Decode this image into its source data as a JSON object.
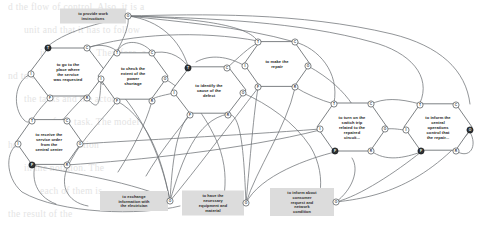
{
  "diagram": {
    "type": "hexagonal-port-node-graph",
    "canvas": {
      "width": 487,
      "height": 229
    },
    "colors": {
      "edge": "#6d7275",
      "hex_fill": "#ffffff",
      "hex_stroke": "#5c6164",
      "plate_fill": "#dcdcdc",
      "port_off_fill": "#ffffff",
      "port_on_fill": "#2e3234",
      "text": "#1d1d1d",
      "bleed_text": "#c9c9c9"
    },
    "port_legend": {
      "T": "top-left port",
      "C": "top-right port",
      "I": "left port",
      "O": "right port",
      "F": "bottom-left port",
      "R": "bottom-right port"
    }
  },
  "nodes": [
    {
      "id": "provide-work-instructions",
      "shape": "plate",
      "label": "to provide work instructions",
      "lines": [
        "to provide work",
        "instructions"
      ],
      "cx": 93,
      "cy": 16,
      "w": 66,
      "h": 15,
      "ports": [
        {
          "key": "O",
          "label": "O",
          "x": 128,
          "y": 16,
          "on": false
        }
      ]
    },
    {
      "id": "go-to-place",
      "shape": "hex",
      "label": "to go to the place where the service was requested",
      "lines": [
        "to go to the",
        "place where",
        "the service",
        "was requested"
      ],
      "cx": 68,
      "cy": 72,
      "rx": 38,
      "ry": 30,
      "ports": [
        {
          "key": "T",
          "label": "T",
          "x": 48,
          "y": 48,
          "on": true
        },
        {
          "key": "C",
          "label": "C",
          "x": 87,
          "y": 48,
          "on": false
        },
        {
          "key": "I",
          "label": "I",
          "x": 31,
          "y": 74,
          "on": false
        },
        {
          "key": "O",
          "label": "O",
          "x": 104,
          "y": 74,
          "on": false
        },
        {
          "key": "F",
          "label": "F",
          "x": 50,
          "y": 98,
          "on": false
        },
        {
          "key": "R",
          "label": "R",
          "x": 87,
          "y": 98,
          "on": false
        }
      ]
    },
    {
      "id": "check-extent-shortage",
      "shape": "hex",
      "label": "to check the extent of the power shortage",
      "lines": [
        "to check the",
        "extent of the",
        "power",
        "shortage"
      ],
      "cx": 133,
      "cy": 76,
      "rx": 35,
      "ry": 29,
      "ports": [
        {
          "key": "T",
          "label": "T",
          "x": 117,
          "y": 53,
          "on": false
        },
        {
          "key": "C",
          "label": "C",
          "x": 152,
          "y": 53,
          "on": false
        },
        {
          "key": "I",
          "label": "I",
          "x": 101,
          "y": 79,
          "on": false
        },
        {
          "key": "O",
          "label": "O",
          "x": 165,
          "y": 79,
          "on": false
        },
        {
          "key": "F",
          "label": "F",
          "x": 117,
          "y": 101,
          "on": false
        },
        {
          "key": "R",
          "label": "R",
          "x": 152,
          "y": 101,
          "on": false
        }
      ]
    },
    {
      "id": "identify-cause-defect",
      "shape": "hex",
      "label": "to identify the cause of the defect",
      "lines": [
        "to identify the",
        "cause of the",
        "defect"
      ],
      "cx": 209,
      "cy": 90,
      "rx": 37,
      "ry": 29,
      "ports": [
        {
          "key": "T",
          "label": "T",
          "x": 188,
          "y": 68,
          "on": true
        },
        {
          "key": "C",
          "label": "C",
          "x": 227,
          "y": 68,
          "on": false
        },
        {
          "key": "I",
          "label": "I",
          "x": 174,
          "y": 93,
          "on": false
        },
        {
          "key": "O",
          "label": "O",
          "x": 243,
          "y": 93,
          "on": false
        },
        {
          "key": "F",
          "label": "F",
          "x": 190,
          "y": 115,
          "on": false
        },
        {
          "key": "R",
          "label": "R",
          "x": 228,
          "y": 115,
          "on": false
        }
      ]
    },
    {
      "id": "make-the-repair",
      "shape": "hex",
      "label": "to make the repair",
      "lines": [
        "to make the",
        "repair"
      ],
      "cx": 277,
      "cy": 64,
      "rx": 33,
      "ry": 28,
      "ports": [
        {
          "key": "T",
          "label": "T",
          "x": 258,
          "y": 42,
          "on": false
        },
        {
          "key": "C",
          "label": "C",
          "x": 295,
          "y": 42,
          "on": false
        },
        {
          "key": "I",
          "label": "I",
          "x": 245,
          "y": 66,
          "on": false
        },
        {
          "key": "O",
          "label": "O",
          "x": 308,
          "y": 66,
          "on": false
        },
        {
          "key": "F",
          "label": "F",
          "x": 258,
          "y": 87,
          "on": false
        },
        {
          "key": "R",
          "label": "R",
          "x": 295,
          "y": 87,
          "on": false
        }
      ]
    },
    {
      "id": "turn-on-switch-trip",
      "shape": "hex",
      "label": "to turn on the switch trip related to the repaired circuit...",
      "lines": [
        "to turn on the",
        "switch trip",
        "related to the",
        "repaired",
        "circuit..."
      ],
      "cx": 352,
      "cy": 127,
      "rx": 35,
      "ry": 30,
      "ports": [
        {
          "key": "T",
          "label": "T",
          "x": 334,
          "y": 104,
          "on": false
        },
        {
          "key": "C",
          "label": "C",
          "x": 371,
          "y": 104,
          "on": false
        },
        {
          "key": "I",
          "label": "I",
          "x": 320,
          "y": 129,
          "on": false
        },
        {
          "key": "O",
          "label": "O",
          "x": 385,
          "y": 129,
          "on": false
        },
        {
          "key": "F",
          "label": "F",
          "x": 335,
          "y": 151,
          "on": true
        },
        {
          "key": "R",
          "label": "R",
          "x": 371,
          "y": 151,
          "on": false
        }
      ]
    },
    {
      "id": "inform-central-operations",
      "shape": "hex",
      "label": "to inform the central operations control that the repair...",
      "lines": [
        "to inform the",
        "central",
        "operations",
        "control that",
        "the repair..."
      ],
      "cx": 438,
      "cy": 127,
      "rx": 34,
      "ry": 29,
      "ports": [
        {
          "key": "T",
          "label": "T",
          "x": 420,
          "y": 105,
          "on": false
        },
        {
          "key": "C",
          "label": "C",
          "x": 456,
          "y": 105,
          "on": false
        },
        {
          "key": "I",
          "label": "I",
          "x": 406,
          "y": 130,
          "on": false
        },
        {
          "key": "O",
          "label": "O",
          "x": 470,
          "y": 130,
          "on": true
        },
        {
          "key": "F",
          "label": "F",
          "x": 421,
          "y": 151,
          "on": true
        },
        {
          "key": "R",
          "label": "R",
          "x": 456,
          "y": 151,
          "on": false
        }
      ]
    },
    {
      "id": "receive-service-order",
      "shape": "hex",
      "label": "to receive the service order from the central center",
      "lines": [
        "to receive the",
        "service order",
        "from the",
        "central center"
      ],
      "cx": 49,
      "cy": 142,
      "rx": 33,
      "ry": 28,
      "ports": [
        {
          "key": "T",
          "label": "T",
          "x": 32,
          "y": 121,
          "on": false
        },
        {
          "key": "C",
          "label": "C",
          "x": 67,
          "y": 121,
          "on": false
        },
        {
          "key": "I",
          "label": "I",
          "x": 18,
          "y": 144,
          "on": false
        },
        {
          "key": "O",
          "label": "O",
          "x": 80,
          "y": 144,
          "on": false
        },
        {
          "key": "F",
          "label": "F",
          "x": 32,
          "y": 165,
          "on": true
        },
        {
          "key": "R",
          "label": "R",
          "x": 67,
          "y": 165,
          "on": false
        }
      ]
    },
    {
      "id": "exchange-information-electrician",
      "shape": "plate",
      "label": "to exchange information with the electrician",
      "lines": [
        "to exchange",
        "information with",
        "the electrician"
      ],
      "cx": 134,
      "cy": 201,
      "w": 68,
      "h": 20,
      "ports": [
        {
          "key": "O",
          "label": "O",
          "x": 170,
          "y": 201,
          "on": false
        }
      ]
    },
    {
      "id": "have-necessary-equipment",
      "shape": "plate",
      "label": "to have the necessary equipment and material",
      "lines": [
        "to have the",
        "necessary",
        "equipment and",
        "material"
      ],
      "cx": 213,
      "cy": 203,
      "w": 62,
      "h": 25,
      "ports": [
        {
          "key": "O",
          "label": "O",
          "x": 246,
          "y": 203,
          "on": false
        }
      ]
    },
    {
      "id": "inform-consumer-request",
      "shape": "plate",
      "label": "to inform about consumer request and network condition",
      "lines": [
        "to inform about",
        "consumer",
        "request and",
        "network",
        "condition"
      ],
      "cx": 302,
      "cy": 202,
      "w": 64,
      "h": 28,
      "ports": [
        {
          "key": "O",
          "label": "O",
          "x": 336,
          "y": 202,
          "on": false
        }
      ]
    }
  ],
  "background_text": {
    "note": "faint scanned bleed-through lines from reverse page",
    "lines": [
      "d the flow of control. Also, it is a",
      "unit and that it has to follow",
      "in the model. Therefore, a",
      "nd to be represented",
      "the tasks and the actors",
      "n of the task. The model",
      "he level of abstraction",
      "in the notation. The",
      "each of them is",
      "the result of the"
    ]
  }
}
